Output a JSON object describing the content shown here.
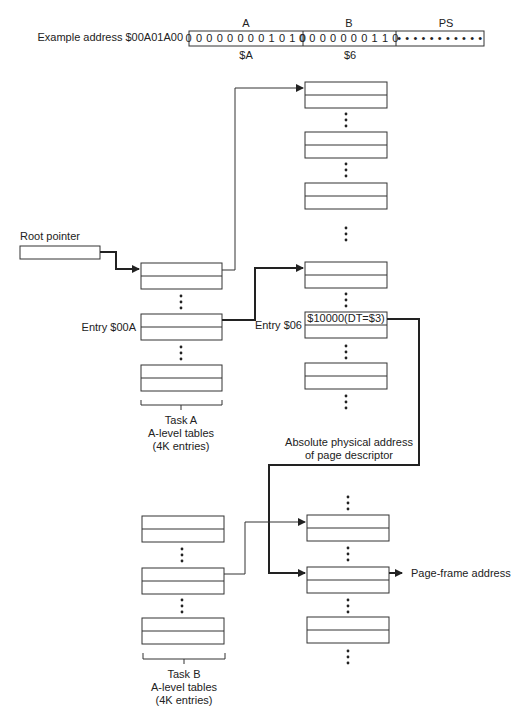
{
  "address": {
    "label": "Example address $00A01A00",
    "fields": [
      {
        "name": "A",
        "bits": "0 0 0 0 0 0 0 0 1 0 1 0",
        "hex": "$A"
      },
      {
        "name": "B",
        "bits": "0 0 0 0 0 0 0 1 1 0",
        "hex": "$6"
      },
      {
        "name": "PS",
        "bits": "• • • • • • • • • • •",
        "hex": ""
      }
    ]
  },
  "labels": {
    "root_pointer": "Root pointer",
    "entry_a": "Entry $00A",
    "entry_b": "Entry $06",
    "descriptor_value": "$10000(DT=$3)",
    "abs_addr_line1": "Absolute physical address",
    "abs_addr_line2": "of page descriptor",
    "page_frame": "Page-frame address"
  },
  "task_a": {
    "line1": "Task A",
    "line2": "A-level tables",
    "line3": "(4K entries)"
  },
  "task_b": {
    "line1": "Task B",
    "line2": "A-level tables",
    "line3": "(4K entries)"
  }
}
